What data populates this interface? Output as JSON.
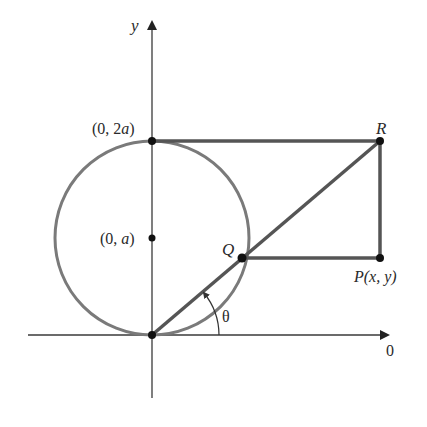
{
  "figure": {
    "axes": {
      "x_label": "0",
      "y_label": "y",
      "color": "#3a3a3a"
    },
    "circle": {
      "color": "#7a7a7a",
      "center_label": "(0, ",
      "center_label_var": "a",
      "center_label_close": ")",
      "top_label": "(0, 2",
      "top_label_var": "a",
      "top_label_close": ")"
    },
    "points": {
      "Q": "Q",
      "R": "R",
      "P_name": "P",
      "P_coords": "(x, y)"
    },
    "angle": {
      "label": "θ"
    },
    "colors": {
      "segment": "#555555",
      "point": "#111111",
      "text": "#2a2a2a"
    }
  }
}
